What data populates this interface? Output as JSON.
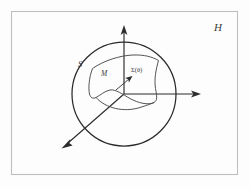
{
  "figure": {
    "background_color": "#fdfdfd",
    "frame": {
      "name": "outer-frame",
      "stroke_color": "#bfbfbf",
      "x": 11,
      "y": 11,
      "width": 227,
      "height": 164
    },
    "ambient_label": {
      "text": "H",
      "x": 218,
      "y": 31,
      "color": "#3a3a3a"
    },
    "sphere": {
      "label": "S",
      "label_x": 80,
      "label_y": 65,
      "center_x": 124,
      "center_y": 94,
      "radius": 52,
      "stroke_color": "#2b2b2b"
    },
    "manifold": {
      "label": "M",
      "label_x": 103,
      "label_y": 75,
      "stroke_color": "#4a4a4a"
    },
    "point": {
      "label": "Σ(θ)",
      "label_x": 133,
      "label_y": 72,
      "marker_x": 131,
      "marker_y": 78
    },
    "axes": [
      {
        "name": "vertical-axis",
        "direction": "up",
        "x1": 124,
        "y1": 94,
        "x2": 124,
        "y2": 27
      },
      {
        "name": "horizontal-axis",
        "direction": "right",
        "x1": 124,
        "y1": 94,
        "x2": 200,
        "y2": 94
      },
      {
        "name": "diagonal-axis",
        "direction": "down-left",
        "x1": 124,
        "y1": 94,
        "x2": 63,
        "y2": 147
      }
    ],
    "pointer": {
      "name": "point-pointer",
      "x1": 117,
      "y1": 89,
      "x2": 131,
      "y2": 77
    }
  }
}
